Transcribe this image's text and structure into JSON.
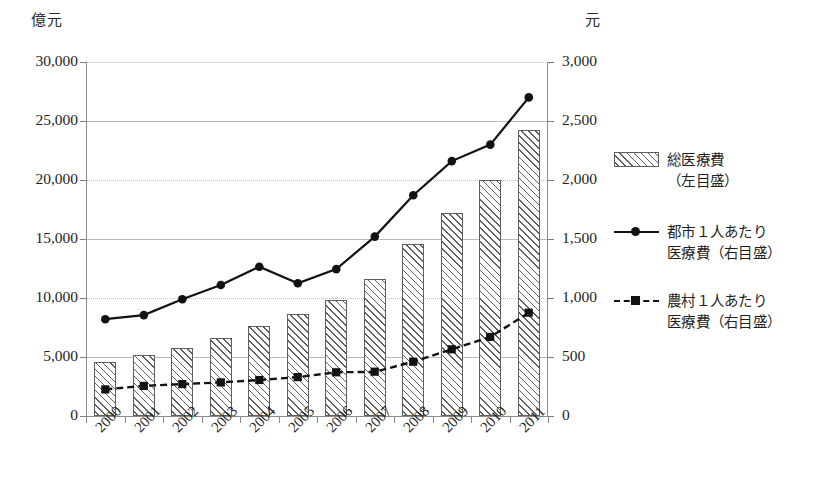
{
  "axes": {
    "left_unit": "億元",
    "right_unit": "元",
    "left_ticks": [
      "30,000",
      "25,000",
      "20,000",
      "15,000",
      "10,000",
      "5,000",
      "0"
    ],
    "right_ticks": [
      "3,000",
      "2,500",
      "2,000",
      "1,500",
      "1,000",
      "500",
      "0"
    ]
  },
  "legend": {
    "items": [
      {
        "label": "総医療費\n（左目盛）",
        "key": "hatched-bar-swatch"
      },
      {
        "label": "都市１人あたり\n医療費（右目盛）",
        "key": "solid-line-circle-marker"
      },
      {
        "label": "農村１人あたり\n医療費（右目盛）",
        "key": "dashed-line-square-marker"
      }
    ]
  },
  "chart_data": {
    "type": "bar",
    "title": "",
    "xlabel": "",
    "ylabel": "億元",
    "y2label": "元",
    "ylim": [
      0,
      30000
    ],
    "y2lim": [
      0,
      3000
    ],
    "grid": true,
    "legend_position": "right",
    "categories": [
      "2000",
      "2001",
      "2002",
      "2003",
      "2004",
      "2005",
      "2006",
      "2007",
      "2008",
      "2009",
      "2010",
      "2011"
    ],
    "series": [
      {
        "name": "総医療費（左目盛）",
        "type": "bar",
        "axis": "left",
        "unit": "億元",
        "values": [
          4590,
          5150,
          5790,
          6580,
          7590,
          8660,
          9840,
          11570,
          14540,
          17200,
          19980,
          24270
        ]
      },
      {
        "name": "都市１人あたり医療費（右目盛）",
        "type": "line",
        "axis": "right",
        "unit": "元",
        "style": "solid",
        "marker": "circle",
        "values": [
          820,
          855,
          990,
          1110,
          1265,
          1125,
          1245,
          1520,
          1870,
          2160,
          2300,
          2700
        ]
      },
      {
        "name": "農村１人あたり医療費（右目盛）",
        "type": "line",
        "axis": "right",
        "unit": "元",
        "style": "dashed",
        "marker": "square",
        "values": [
          225,
          255,
          270,
          285,
          305,
          330,
          370,
          375,
          460,
          565,
          670,
          875
        ]
      }
    ]
  },
  "colors": {
    "ink": "#121212",
    "axis": "#8c8c8c",
    "grid": "#b9b9b9",
    "hatch": "#5e5e5e",
    "background": "#ffffff"
  }
}
